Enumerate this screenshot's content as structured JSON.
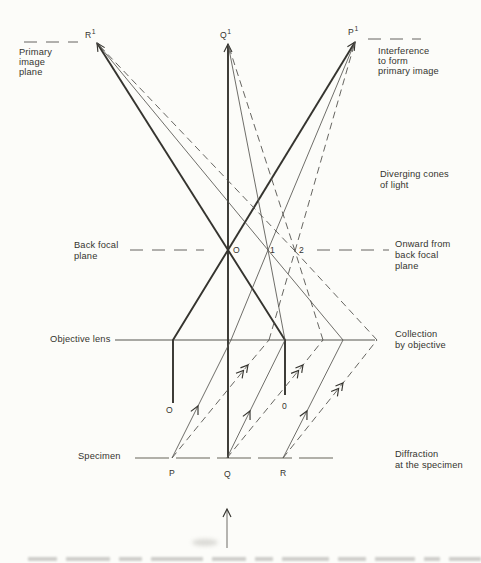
{
  "colors": {
    "background": "#fcfcf9",
    "ink": "#35342f",
    "ray": "#55544f",
    "muted": "#98968e"
  },
  "plane_labels": {
    "primary_image_plane": [
      "Primary",
      "image",
      "plane"
    ],
    "back_focal_plane": [
      "Back focal",
      "plane"
    ],
    "objective_lens": "Objective lens",
    "specimen": "Specimen"
  },
  "process_labels": {
    "interference": [
      "Interference",
      "to form",
      "primary image"
    ],
    "diverging_cones": [
      "Diverging cones",
      "of light"
    ],
    "onward": [
      "Onward from",
      "back focal",
      "plane"
    ],
    "collection": [
      "Collection",
      "by objective"
    ],
    "diffraction": [
      "Diffraction",
      "at the specimen"
    ]
  },
  "image_plane_points": {
    "R": {
      "base": "R",
      "sup": "1"
    },
    "Q": {
      "base": "Q",
      "sup": "1"
    },
    "P": {
      "base": "P",
      "sup": "1"
    }
  },
  "back_focal_plane_points": {
    "direct": "O",
    "first_order": "1",
    "second_order": "2"
  },
  "direct_beam_labels": {
    "from_P": "O",
    "from_R": "0"
  },
  "specimen_points": {
    "P": "P",
    "Q": "Q",
    "R": "R"
  }
}
